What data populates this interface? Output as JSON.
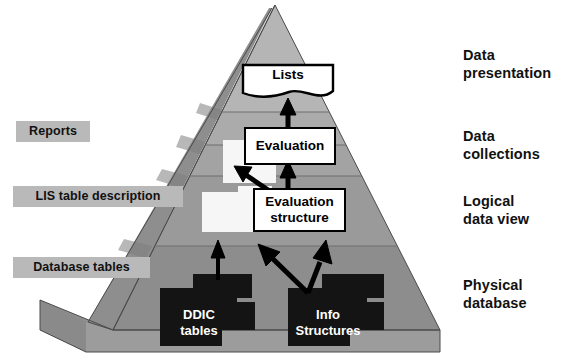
{
  "diagram": {
    "type": "layered-pyramid",
    "colors": {
      "band_presentation": "#b5b5b5",
      "band_collections": "#a8a8a8",
      "band_logical": "#9a9a9a",
      "band_physical": "#8d8d8d",
      "left_face": "#8a8a8a",
      "base_face": "#9c9c9c",
      "tag_background": "#b9b9b9",
      "box_fill": "#ffffff",
      "box_border": "#000000",
      "stack_fill": "#141414",
      "stack_text": "#ffffff",
      "white_block": "#f4f4f4",
      "arrow": "#000000",
      "page_background": "#ffffff"
    },
    "stage_labels": [
      {
        "id": "data-presentation",
        "text": "Data\npresentation"
      },
      {
        "id": "data-collections",
        "text": "Data\ncollections"
      },
      {
        "id": "logical-data-view",
        "text": "Logical\ndata view"
      },
      {
        "id": "physical-database",
        "text": "Physical\ndatabase"
      }
    ],
    "tags": [
      {
        "id": "reports",
        "text": "Reports"
      },
      {
        "id": "lis-table-description",
        "text": "LIS table description"
      },
      {
        "id": "database-tables",
        "text": "Database tables"
      }
    ],
    "boxes": [
      {
        "id": "lists",
        "text": "Lists",
        "shape": "document"
      },
      {
        "id": "evaluation",
        "text": "Evaluation",
        "shape": "rect"
      },
      {
        "id": "evaluation-structure",
        "text": "Evaluation\nstructure",
        "shape": "rect"
      }
    ],
    "stacks": [
      {
        "id": "ddic-tables",
        "text": "DDIC\ntables"
      },
      {
        "id": "info-structures",
        "text": "Info\nStructures"
      }
    ],
    "flows": [
      {
        "from": "evaluation",
        "to": "lists"
      },
      {
        "from": "evaluation-structure",
        "to": "evaluation"
      },
      {
        "from": "evaluation-structure",
        "to": "lis-table-stack"
      },
      {
        "from": "ddic-tables",
        "to": "lis-table-stack"
      },
      {
        "from": "info-structures",
        "to": "evaluation-structure"
      }
    ]
  }
}
